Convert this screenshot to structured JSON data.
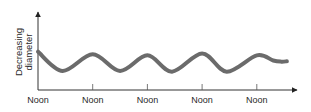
{
  "chart_data": {
    "type": "line",
    "title": "",
    "xlabel": "",
    "ylabel": "Decreasing diameter",
    "ylabel_lines": [
      "Decreasing",
      "diameter"
    ],
    "x_ticks": [
      0,
      1,
      2,
      3,
      4
    ],
    "x_tick_labels": [
      "Noon",
      "Noon",
      "Noon",
      "Noon",
      "Noon"
    ],
    "xlim": [
      0,
      4.65
    ],
    "ylim": [
      0,
      1
    ],
    "grid": false,
    "legend": null,
    "y_tick_labels": [],
    "series": [
      {
        "name": "diameter",
        "color": "#6b6b6b",
        "x": [
          0,
          0.45,
          1.0,
          1.5,
          2.0,
          2.45,
          3.0,
          3.45,
          4.0,
          4.3,
          4.45,
          4.55
        ],
        "y": [
          0.82,
          0.3,
          0.75,
          0.3,
          0.72,
          0.28,
          0.77,
          0.28,
          0.72,
          0.58,
          0.55,
          0.56
        ]
      }
    ],
    "axis_color": "#333333"
  }
}
